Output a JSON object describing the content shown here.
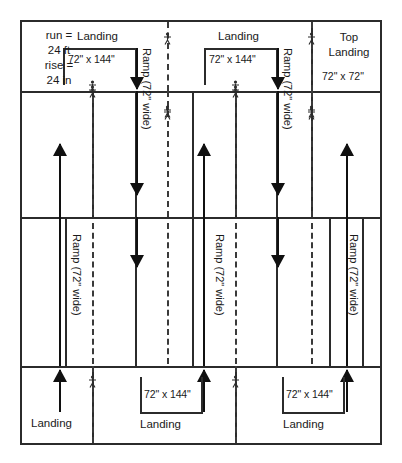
{
  "diagram": {
    "colors": {
      "line": "#2b2b2b",
      "arrow": "#101010",
      "background": "#ffffff",
      "text": "#1a1a1a"
    },
    "rows": [
      {
        "id": "row-top-landings",
        "name": "top-landing-row"
      },
      {
        "id": "row-upper-ramps",
        "name": "upper-ramp-row"
      },
      {
        "id": "row-lower-ramps",
        "name": "lower-ramp-row"
      },
      {
        "id": "row-bottom-landings",
        "name": "bottom-landing-row"
      }
    ],
    "labels": {
      "landing": "Landing",
      "top_landing_line1": "Top",
      "top_landing_line2": "Landing",
      "landing_dim_72x144": "72\" x 144\"",
      "top_landing_dim": "72\" x 72\"",
      "ramp_width": "Ramp (72\" wide)",
      "run_line1": "run =",
      "run_line2": "24 ft",
      "rise_line1": "rise =",
      "rise_line2": "24 in"
    },
    "top_row": {
      "landing_1": {
        "title": "Landing",
        "dimension": "72\" x 144\""
      },
      "landing_2": {
        "title": "Landing",
        "dimension": "72\" x 144\""
      },
      "top_landing": {
        "title_line1": "Top",
        "title_line2": "Landing",
        "dimension": "72\" x 72\""
      }
    },
    "stats": {
      "run_label": "run =",
      "run_value": "24 ft",
      "rise_label": "rise =",
      "rise_value": "24 in"
    },
    "upper_ramps": [
      {
        "label": "Ramp (72\" wide)",
        "direction": "down"
      },
      {
        "label": "Ramp (72\" wide)",
        "direction": "down"
      }
    ],
    "lower_ramps": [
      {
        "label": "Ramp (72\" wide)",
        "direction": "up"
      },
      {
        "label": "Ramp (72\" wide)",
        "direction": "up"
      },
      {
        "label": "Ramp (72\" wide)",
        "direction": "up"
      }
    ],
    "bottom_row": {
      "landing_1": {
        "title": "Landing",
        "dimension": ""
      },
      "landing_2": {
        "title": "Landing",
        "dimension": "72\" x 144\""
      },
      "landing_3": {
        "title": "Landing",
        "dimension": "72\" x 144\""
      }
    }
  }
}
